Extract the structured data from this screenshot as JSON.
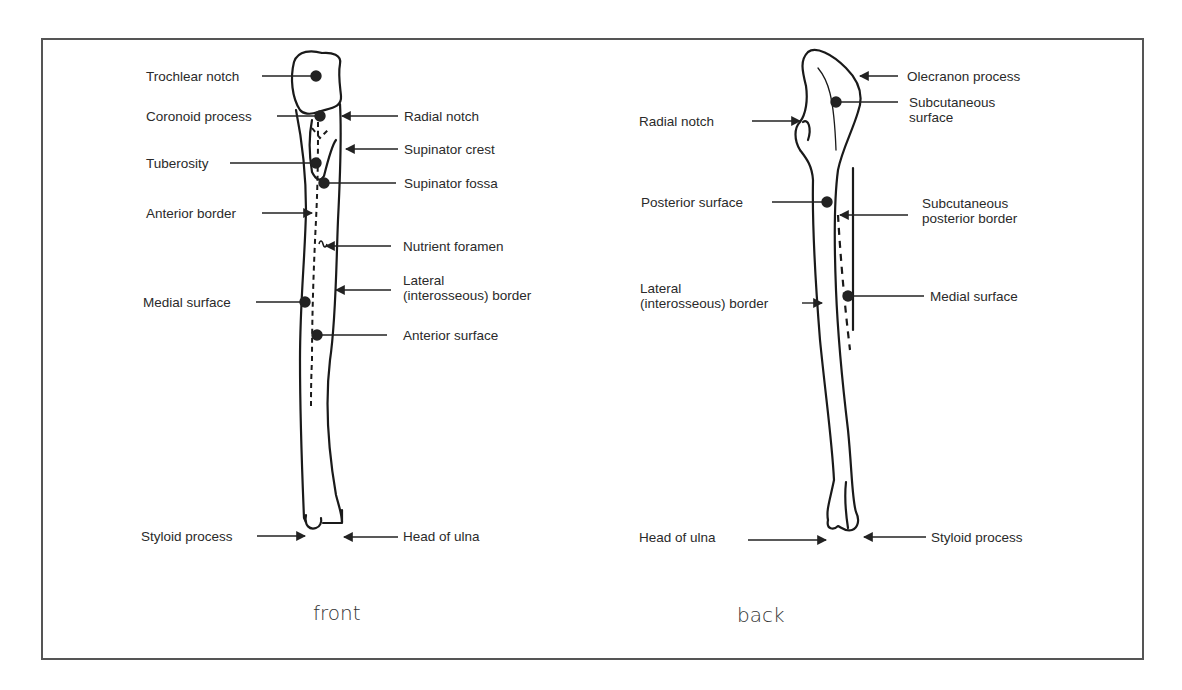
{
  "figure": {
    "subject": "Ulna",
    "views": [
      {
        "id": "front",
        "title": "front",
        "labels_left": [
          {
            "text": "Trochlear notch",
            "marker": "dot"
          },
          {
            "text": "Coronoid process",
            "marker": "dot"
          },
          {
            "text": "Tuberosity",
            "marker": "dot"
          },
          {
            "text": "Anterior border",
            "marker": "arrow"
          },
          {
            "text": "Medial surface",
            "marker": "dot"
          },
          {
            "text": "Styloid process",
            "marker": "arrow"
          }
        ],
        "labels_right": [
          {
            "text": "Radial notch",
            "marker": "arrow"
          },
          {
            "text": "Supinator crest",
            "marker": "arrow"
          },
          {
            "text": "Supinator fossa",
            "marker": "dot"
          },
          {
            "text": "Nutrient foramen",
            "marker": "arrow"
          },
          {
            "text_lines": [
              "Lateral",
              "(interosseous) border"
            ],
            "marker": "arrow"
          },
          {
            "text": "Anterior surface",
            "marker": "dot"
          },
          {
            "text": "Head of ulna",
            "marker": "arrow"
          }
        ]
      },
      {
        "id": "back",
        "title": "back",
        "labels_left": [
          {
            "text": "Radial notch",
            "marker": "arrow"
          },
          {
            "text": "Posterior surface",
            "marker": "dot"
          },
          {
            "text_lines": [
              "Lateral",
              "(interosseous) border"
            ],
            "marker": "arrow"
          },
          {
            "text": "Head of ulna",
            "marker": "arrow"
          }
        ],
        "labels_right": [
          {
            "text": "Olecranon process",
            "marker": "arrow"
          },
          {
            "text_lines": [
              "Subcutaneous",
              "surface"
            ],
            "marker": "dot"
          },
          {
            "text_lines": [
              "Subcutaneous",
              "posterior border"
            ],
            "marker": "arrow"
          },
          {
            "text": "Medial surface",
            "marker": "dot"
          },
          {
            "text": "Styloid process",
            "marker": "arrow"
          }
        ]
      }
    ]
  }
}
